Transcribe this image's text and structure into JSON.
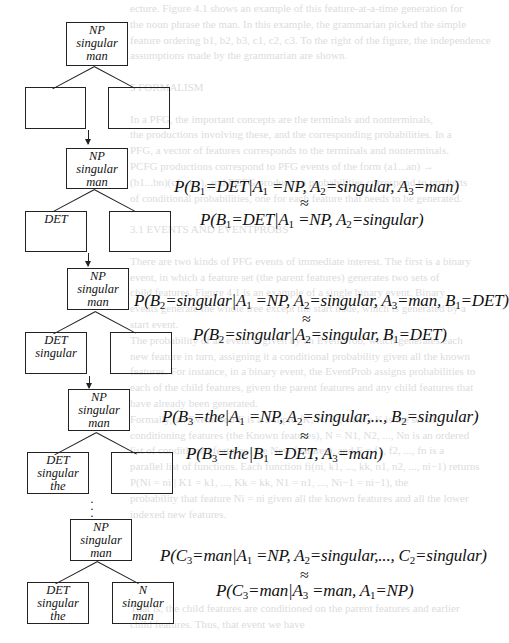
{
  "background_bleed": [
    "ecture. Figure 4.1 shows an example of this feature-at-a-time generation for",
    "the noun phrase the man. In this example, the grammarian picked the simple",
    "feature ordering b1, b2, b3, c1, c2, c3. To the right of the figure, the independence",
    "assumptions made by the grammarian are shown.",
    "",
    "5   FORMALISM",
    "",
    "In a PFG, the important concepts are the terminals and nonterminals,",
    "the productions involving these, and the corresponding probabilities. In a",
    "PFG, a vector of features corresponds to the terminals and nonterminals.",
    "PCFG productions correspond to PFG events of the form (a1...an) →",
    "(b1...bn)(c1...cn), and PCFG production probabilities correspond to products",
    "of conditional probabilities, one for each feature that needs to be generated.",
    "",
    "3.1   EVENTS AND EVENTPROBS",
    "",
    "There are two kinds of PFG events of immediate interest. The first is a binary",
    "event, in which a feature set (the parent features) generates two sets of",
    "child features. Figure 4.1 is an example of a single binary event. Binary",
    "events generate the whole tree except the start node, which is generated by a",
    "start event.",
    "The probability of an event is given by an EventProb, which generates each",
    "new feature in turn, assigning it a conditional probability given all the known",
    "features. For instance, in a binary event, the EventProb assigns probabilities to",
    "each of the child features, given the parent features and any child features that",
    "have already been generated.",
    "Formally, an EventProb E is a 3-tuple ⟨K, N, F⟩, where K is the set of",
    "conditioning features (the Known features), N = N1, N2, ..., Nn is an ordered",
    "list of conditioned features (the New features), and F = f1, f2, ..., fn is a",
    "parallel list of functions. Each function fi(ni, k1, ..., kk, n1, n2, ..., ni−1) returns",
    "P(Ni = ni | K1 = k1, ..., Kk = kk, N1 = n1, ..., Ni−1 = ni−1), the",
    "probability that feature Ni = ni given all the known features and all the lower",
    "indexed new features.",
    "",
    "",
    "",
    "",
    "",
    "That is, the child features are conditioned on the parent features and earlier",
    "child features. Thus, that event we have"
  ],
  "figure": {
    "stages": [
      {
        "parent": [
          "NP",
          "singular",
          "man"
        ],
        "left_child": [],
        "right_child": []
      },
      {
        "parent": [
          "NP",
          "singular",
          "man"
        ],
        "left_child": [
          "DET"
        ],
        "right_child": [],
        "formula": {
          "full": "P(B1=DET|A1 =NP, A2=singular, A3=man)",
          "approx_symbol": "≈",
          "reduced": "P(B1=DET|A1 =NP, A2=singular)"
        }
      },
      {
        "parent": [
          "NP",
          "singular",
          "man"
        ],
        "left_child": [
          "DET",
          "singular"
        ],
        "right_child": [],
        "formula": {
          "full": "P(B2=singular|A1 =NP, A2=singular, A3=man, B1=DET)",
          "approx_symbol": "≈",
          "reduced": "P(B2=singular|A2=singular, B1=DET)"
        }
      },
      {
        "parent": [
          "NP",
          "singular",
          "man"
        ],
        "left_child": [
          "DET",
          "singular",
          "the"
        ],
        "right_child": [],
        "formula": {
          "full": "P(B3=the|A1 =NP, A2=singular,..., B2=singular)",
          "approx_symbol": "≈",
          "reduced": "P(B3=the|B1 =DET, A3=man)"
        }
      },
      {
        "parent": [
          "NP",
          "singular",
          "man"
        ],
        "left_child": [
          "DET",
          "singular",
          "the"
        ],
        "right_child": [
          "N",
          "singular",
          "man"
        ],
        "formula": {
          "full": "P(C3=man|A1 =NP, A2=singular,..., C2=singular)",
          "approx_symbol": "≈",
          "reduced": "P(C3=man|A3 =man, A1=NP)"
        }
      }
    ],
    "ellipsis": "⋮"
  },
  "formula_parts": {
    "f1a": [
      "P(B",
      "1",
      "=DET|A",
      "1",
      " =NP, A",
      "2",
      "=singular, A",
      "3",
      "=man)"
    ],
    "f1b": [
      "P(B",
      "1",
      "=DET|A",
      "1",
      " =NP, A",
      "2",
      "=singular)"
    ],
    "f2a": [
      "P(B",
      "2",
      "=singular|A",
      "1",
      " =NP, A",
      "2",
      "=singular, A",
      "3",
      "=man, B",
      "1",
      "=DET)"
    ],
    "f2b": [
      "P(B",
      "2",
      "=singular|A",
      "2",
      "=singular, B",
      "1",
      "=DET)"
    ],
    "f3a": [
      "P(B",
      "3",
      "=the|A",
      "1",
      " =NP, A",
      "2",
      "=singular,..., B",
      "2",
      "=singular)"
    ],
    "f3b": [
      "P(B",
      "3",
      "=the|B",
      "1",
      " =DET, A",
      "3",
      "=man)"
    ],
    "f4a": [
      "P(C",
      "3",
      "=man|A",
      "1",
      " =NP, A",
      "2",
      "=singular,..., C",
      "2",
      "=singular)"
    ],
    "f4b": [
      "P(C",
      "3",
      "=man|A",
      "3",
      " =man, A",
      "1",
      "=NP)"
    ]
  }
}
